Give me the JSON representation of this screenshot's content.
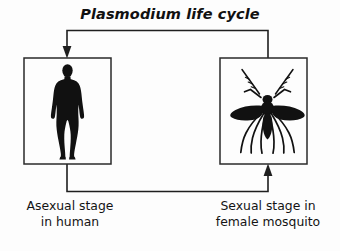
{
  "figure": {
    "title": "Plasmodium life cycle",
    "background_color": "#fdfdfd",
    "ink_color": "#1a1a1a"
  },
  "nodes": [
    {
      "id": "human",
      "icon": "human-silhouette-icon",
      "caption_line1": "Asexual stage",
      "caption_line2": "in human",
      "box": {
        "x": 24,
        "y": 58,
        "width": 87,
        "height": 106
      }
    },
    {
      "id": "mosquito",
      "icon": "mosquito-silhouette-icon",
      "caption_line1": "Sexual stage in",
      "caption_line2": "female mosquito",
      "box": {
        "x": 220,
        "y": 58,
        "width": 87,
        "height": 106
      }
    }
  ],
  "arrows": [
    {
      "id": "mosquito-to-human",
      "from": "mosquito",
      "to": "human",
      "direction": "top-route-leftward",
      "head": "down"
    },
    {
      "id": "human-to-mosquito",
      "from": "human",
      "to": "mosquito",
      "direction": "bottom-route-rightward",
      "head": "up"
    }
  ]
}
